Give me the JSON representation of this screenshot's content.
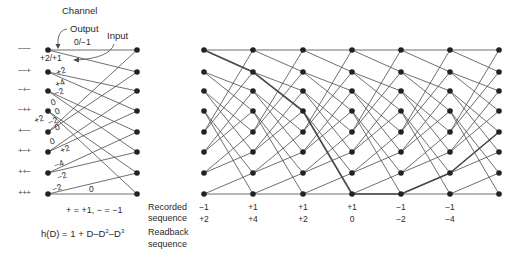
{
  "left_trellis": {
    "title": "Channel",
    "output_label": "Output",
    "input_label": "Input",
    "states": [
      "−−−",
      "−−+",
      "−+−",
      "−++",
      "+−−",
      "+−+",
      "++−",
      "+++"
    ],
    "edge_labels": [
      {
        "text": "0/−1",
        "x": 74,
        "y": 38
      },
      {
        "text": "+2/+1",
        "x": 40,
        "y": 54
      },
      {
        "text": "+2",
        "x": 56,
        "y": 67
      },
      {
        "text": "+4",
        "x": 55,
        "y": 79
      },
      {
        "text": "−2",
        "x": 54,
        "y": 88
      },
      {
        "text": "0",
        "x": 51,
        "y": 98
      },
      {
        "text": "0",
        "x": 55,
        "y": 107
      },
      {
        "text": "+2",
        "x": 34,
        "y": 115
      },
      {
        "text": "−2",
        "x": 48,
        "y": 117
      },
      {
        "text": "0",
        "x": 55,
        "y": 123
      },
      {
        "text": "0",
        "x": 50,
        "y": 137
      },
      {
        "text": "+2",
        "x": 60,
        "y": 145
      },
      {
        "text": "−4",
        "x": 54,
        "y": 160
      },
      {
        "text": "−2",
        "x": 57,
        "y": 172
      },
      {
        "text": "−2",
        "x": 52,
        "y": 184
      },
      {
        "text": "0",
        "x": 89,
        "y": 185
      }
    ],
    "legend": "+ = +1, − = −1",
    "formula": {
      "prefix": "h(D) = 1 + D–D",
      "exp1": "2",
      "mid": "–D",
      "exp2": "3"
    }
  },
  "main_trellis": {
    "recorded_label": [
      "Recorded",
      "sequence"
    ],
    "readback_label": [
      "Readback",
      "sequence"
    ],
    "recorded_sequence": [
      "−1",
      "+1",
      "+1",
      "+1",
      "−1",
      "−1"
    ],
    "readback_sequence": [
      "+2",
      "+4",
      "+2",
      "0",
      "−2",
      "−4"
    ],
    "highlighted_path_rows": [
      0,
      1,
      3,
      7,
      7,
      6,
      4
    ]
  },
  "colors": {
    "line": "#4a4a4a",
    "node": "#222222",
    "text": "#2a2a2a"
  }
}
